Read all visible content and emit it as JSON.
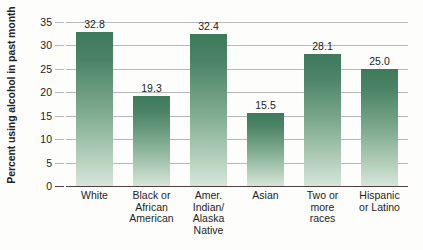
{
  "chart_data": {
    "type": "bar",
    "title": "",
    "subtitle": "",
    "xlabel": "",
    "ylabel": "Percent using alcohol in past month",
    "ylim": [
      0,
      35
    ],
    "yticks": [
      0,
      5,
      10,
      15,
      20,
      25,
      30,
      35
    ],
    "ytick_labels": [
      "0",
      "5",
      "10",
      "15",
      "20",
      "25",
      "30",
      "35"
    ],
    "grid": true,
    "legend": "none",
    "categories": [
      "White",
      "Black or\nAfrican\nAmerican",
      "Amer.\nIndian/\nAlaska\nNative",
      "Asian",
      "Two or\nmore\nraces",
      "Hispanic\nor Latino"
    ],
    "values": [
      32.8,
      19.3,
      32.4,
      15.5,
      28.1,
      25.0
    ],
    "value_labels": [
      "32.8",
      "19.3",
      "32.4",
      "15.5",
      "28.1",
      "25.0"
    ],
    "colors": {
      "bar_top": "#3d7a5b",
      "bar_bottom": "#d6e6da",
      "gridline": "#b6bab9",
      "axis": "#4c3f46",
      "text": "#1d1d1d",
      "background": "#fdfdfc"
    }
  }
}
